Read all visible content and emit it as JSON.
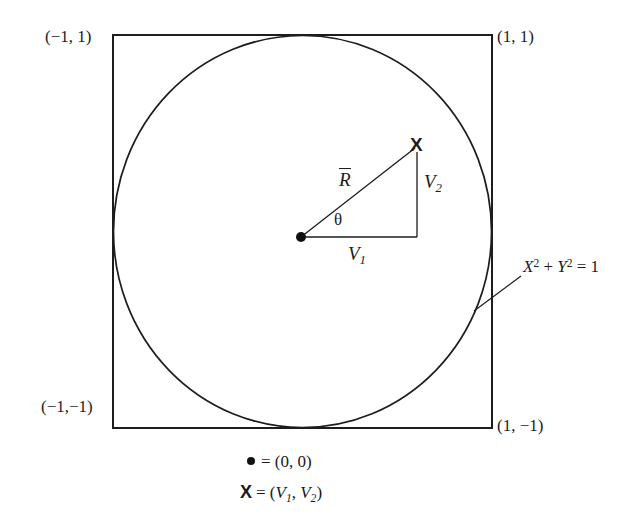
{
  "figure": {
    "type": "geometry-diagram",
    "background_color": "#ffffff",
    "line_color": "#1d1d1d",
    "square": {
      "corner_labels": {
        "top_left": "(−1, 1)",
        "top_right": "(1, 1)",
        "bottom_left": "(−1,−1)",
        "bottom_right": "(1, −1)"
      }
    },
    "circle": {
      "equation_parts": {
        "x_base": "X",
        "x_exp": "2",
        "plus": "+",
        "y_base": "Y",
        "y_exp": "2",
        "equals": "= 1"
      },
      "equation_text": "X2 + Y2 = 1"
    },
    "vector": {
      "magnitude_label": "R",
      "angle_label": "θ",
      "point_label": "X",
      "component_x_base": "V",
      "component_x_sub": "1",
      "component_y_base": "V",
      "component_y_sub": "2"
    },
    "legend": {
      "origin_glyph": "●",
      "origin_equals": "=",
      "origin_value": "(0, 0)",
      "point_glyph": "X",
      "point_equals": "=",
      "point_open": "(",
      "point_v1_base": "V",
      "point_v1_sub": "1",
      "point_comma": ",",
      "point_v2_base": "V",
      "point_v2_sub": "2",
      "point_close": ")"
    }
  }
}
